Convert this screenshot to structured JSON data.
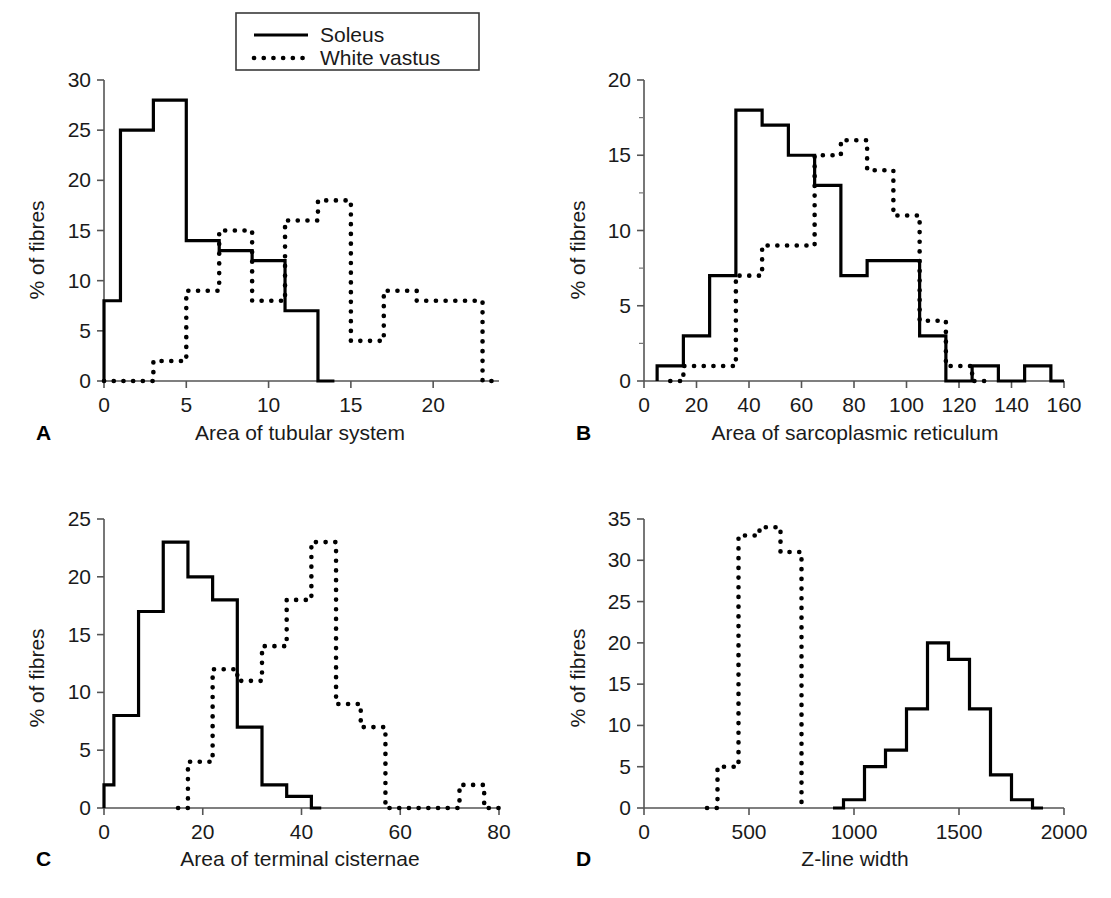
{
  "figure": {
    "legend": {
      "entries": [
        {
          "label": "Soleus",
          "style": "solid"
        },
        {
          "label": "White vastus",
          "style": "dotted"
        }
      ]
    }
  },
  "chart_data": [
    {
      "type": "line",
      "panel": "A",
      "title": "",
      "xlabel": "Area of tubular system",
      "ylabel": "% of fibres",
      "xlim": [
        0,
        24
      ],
      "ylim": [
        0,
        30
      ],
      "xticks": [
        0,
        5,
        10,
        15,
        20
      ],
      "xticklabels": [
        "0",
        "5",
        "10",
        "15",
        "20"
      ],
      "yticks": [
        0,
        5,
        10,
        15,
        20,
        25,
        30
      ],
      "yticklabels": [
        "0",
        "5",
        "10",
        "15",
        "20",
        "25",
        "30"
      ],
      "grid": false,
      "series": [
        {
          "name": "Soleus",
          "style": "solid",
          "bin_edges": [
            0,
            1,
            3,
            5,
            7,
            9,
            11,
            13,
            14
          ],
          "values": [
            8,
            25,
            28,
            14,
            13,
            12,
            7,
            0
          ]
        },
        {
          "name": "White vastus",
          "style": "dotted",
          "bin_edges": [
            0,
            3,
            5,
            7,
            9,
            11,
            13,
            15,
            17,
            19,
            23,
            24
          ],
          "values": [
            0,
            2,
            9,
            15,
            8,
            16,
            18,
            4,
            9,
            8,
            0
          ]
        }
      ]
    },
    {
      "type": "line",
      "panel": "B",
      "title": "",
      "xlabel": "Area of sarcoplasmic reticulum",
      "ylabel": "% of fibres",
      "xlim": [
        0,
        160
      ],
      "ylim": [
        0,
        20
      ],
      "xticks": [
        0,
        20,
        40,
        60,
        80,
        100,
        120,
        140,
        160
      ],
      "xticklabels": [
        "0",
        "20",
        "40",
        "60",
        "80",
        "100",
        "120",
        "140",
        "160"
      ],
      "yticks": [
        0,
        5,
        10,
        15,
        20
      ],
      "yticklabels": [
        "0",
        "5",
        "10",
        "15",
        "20"
      ],
      "yticks_minor": [
        2.5,
        7.5,
        12.5,
        17.5
      ],
      "grid": false,
      "series": [
        {
          "name": "Soleus",
          "style": "solid",
          "bin_edges": [
            5,
            15,
            25,
            35,
            45,
            55,
            65,
            75,
            85,
            95,
            105,
            115,
            125,
            135,
            145,
            155,
            160
          ],
          "values": [
            1,
            3,
            7,
            18,
            17,
            15,
            13,
            7,
            8,
            8,
            3,
            0,
            1,
            0,
            1,
            0
          ]
        },
        {
          "name": "White vastus",
          "style": "dotted",
          "bin_edges": [
            10,
            15,
            35,
            45,
            65,
            75,
            85,
            95,
            105,
            115,
            125,
            130
          ],
          "values": [
            0,
            1,
            7,
            9,
            15,
            16,
            14,
            11,
            4,
            1,
            0
          ]
        }
      ]
    },
    {
      "type": "line",
      "panel": "C",
      "title": "",
      "xlabel": "Area of terminal cisternae",
      "ylabel": "% of fibres",
      "xlim": [
        0,
        80
      ],
      "ylim": [
        0,
        25
      ],
      "xticks": [
        0,
        20,
        40,
        60,
        80
      ],
      "xticklabels": [
        "0",
        "20",
        "40",
        "60",
        "80"
      ],
      "yticks": [
        0,
        5,
        10,
        15,
        20,
        25
      ],
      "yticklabels": [
        "0",
        "5",
        "10",
        "15",
        "20",
        "25"
      ],
      "grid": false,
      "series": [
        {
          "name": "Soleus",
          "style": "solid",
          "bin_edges": [
            0,
            2,
            7,
            12,
            17,
            22,
            27,
            32,
            37,
            42,
            44
          ],
          "values": [
            2,
            8,
            17,
            23,
            20,
            18,
            7,
            2,
            1,
            0
          ]
        },
        {
          "name": "White vastus",
          "style": "dotted",
          "bin_edges": [
            15,
            17,
            22,
            27,
            32,
            37,
            42,
            47,
            52,
            57,
            72,
            77,
            80
          ],
          "values": [
            0,
            4,
            12,
            11,
            14,
            18,
            23,
            9,
            7,
            0,
            2,
            0
          ]
        }
      ]
    },
    {
      "type": "line",
      "panel": "D",
      "title": "",
      "xlabel": "Z-line width",
      "ylabel": "% of fibres",
      "xlim": [
        0,
        2000
      ],
      "ylim": [
        0,
        35
      ],
      "xticks": [
        0,
        500,
        1000,
        1500,
        2000
      ],
      "xticklabels": [
        "0",
        "500",
        "1000",
        "1500",
        "2000"
      ],
      "yticks": [
        0,
        5,
        10,
        15,
        20,
        25,
        30,
        35
      ],
      "yticklabels": [
        "0",
        "5",
        "10",
        "15",
        "20",
        "25",
        "30",
        "35"
      ],
      "grid": false,
      "series": [
        {
          "name": "Soleus",
          "style": "solid",
          "bin_edges": [
            900,
            950,
            1050,
            1150,
            1250,
            1350,
            1450,
            1550,
            1650,
            1750,
            1850,
            1900
          ],
          "values": [
            0,
            1,
            5,
            7,
            12,
            20,
            18,
            12,
            4,
            1,
            0
          ]
        },
        {
          "name": "White vastus",
          "style": "dotted",
          "bin_edges": [
            300,
            350,
            450,
            550,
            650,
            750,
            760
          ],
          "values": [
            0,
            5,
            33,
            34,
            31,
            0
          ]
        }
      ]
    }
  ]
}
